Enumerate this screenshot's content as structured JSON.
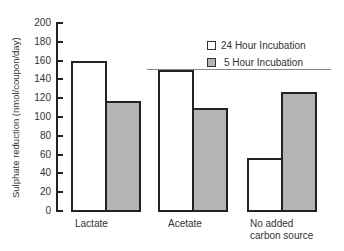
{
  "chart_data": {
    "type": "bar",
    "title": "",
    "xlabel": "",
    "ylabel": "Sulphate reduction (nmol/coupon/day)",
    "ylim": [
      0,
      200
    ],
    "yticks": [
      0,
      20,
      40,
      60,
      80,
      100,
      120,
      140,
      160,
      180,
      200
    ],
    "categories": [
      "Lactate",
      "Acetate",
      "No added carbon source"
    ],
    "category_labels": [
      [
        "Lactate"
      ],
      [
        "Acetate"
      ],
      [
        "No added",
        "carbon source"
      ]
    ],
    "series": [
      {
        "name": "24 Hour Incubation",
        "fill": "white",
        "values": [
          160,
          150,
          56
        ]
      },
      {
        "name": "5 Hour Incubation",
        "fill": "stippled",
        "values": [
          117,
          110,
          127
        ]
      }
    ],
    "grid": false,
    "legend_position": "upper right"
  },
  "legend": {
    "items": [
      {
        "label": "24 Hour Incubation"
      },
      {
        "label": "5 Hour Incubation"
      }
    ]
  }
}
